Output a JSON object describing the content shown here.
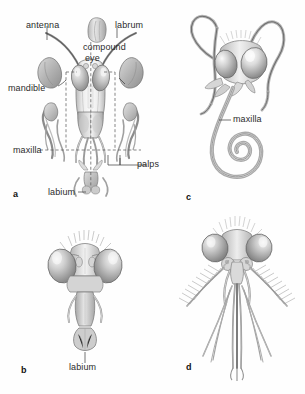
{
  "figure": {
    "type": "scientific-illustration",
    "style": "grayscale pencil/airbrush rendering on white",
    "palette": {
      "background": "#ffffff",
      "ink": "#2b2b2b",
      "fill_light": "#e6e6e6",
      "fill_mid": "#c4c4c4",
      "fill_dark": "#9a9a9a",
      "outline": "#6f6f6f",
      "dashed_guide": "#555555"
    },
    "panel_count": 4
  },
  "panels": [
    {
      "letter": "a",
      "name": "generalized-chewing-mouthparts",
      "description": "front view of a grasshopper-type head with mouthparts displayed in exploded arrangement",
      "labels": [
        {
          "key": "antenna",
          "text": "antenna"
        },
        {
          "key": "labrum",
          "text": "labrum"
        },
        {
          "key": "compound_eye",
          "text": "compound\neye",
          "line1": "compound",
          "line2": "eye"
        },
        {
          "key": "mandible",
          "text": "mandible"
        },
        {
          "key": "maxilla",
          "text": "maxilla"
        },
        {
          "key": "palps",
          "text": "palps"
        },
        {
          "key": "labium",
          "text": "labium"
        }
      ]
    },
    {
      "letter": "b",
      "name": "housefly-sponging-mouthparts",
      "description": "front view of a fly head with a sponging labium",
      "labels": [
        {
          "key": "labium",
          "text": "labium"
        }
      ]
    },
    {
      "letter": "c",
      "name": "butterfly-siphoning-mouthparts",
      "description": "butterfly head with long coiled proboscis formed from the maxillae",
      "labels": [
        {
          "key": "maxilla",
          "text": "maxilla"
        }
      ]
    },
    {
      "letter": "d",
      "name": "mosquito-piercing-sucking-mouthparts",
      "description": "male mosquito head with plumose antennae and elongate piercing stylets",
      "labels": []
    }
  ],
  "label_text": {
    "antenna": "antenna",
    "labrum": "labrum",
    "compound_line1": "compound",
    "compound_line2": "eye",
    "mandible": "mandible",
    "maxilla_a": "maxilla",
    "palps": "palps",
    "labium_a": "labium",
    "labium_b": "labium",
    "maxilla_c": "maxilla"
  },
  "panel_letters": {
    "a": "a",
    "b": "b",
    "c": "c",
    "d": "d"
  }
}
